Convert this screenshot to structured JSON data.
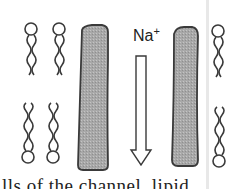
{
  "figure": {
    "ion_label": "Na",
    "ion_charge": "+",
    "caption_fragment": "lls of the channel, lipid",
    "colors": {
      "protein_fill": "#a9a9a9",
      "outline": "#3a3a3a",
      "background": "#ffffff",
      "divider": "#e8e8e8"
    },
    "elements": {
      "lipids_left_top": 2,
      "lipids_left_bottom": 2,
      "lipids_right_top": 1,
      "lipids_right_bottom": 1,
      "protein_subunits": 2,
      "arrow_direction": "down"
    }
  }
}
